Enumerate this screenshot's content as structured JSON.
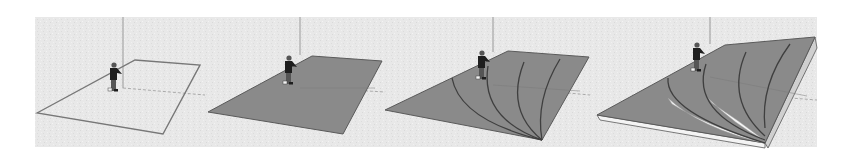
{
  "figure": {
    "description": "Four-step 3D modeling sequence of a sloped terrain surface with a human scale figure",
    "background": {
      "x": 35,
      "y": 17,
      "w": 782,
      "h": 130,
      "color": "#e9e9e9"
    },
    "colors": {
      "face": "#8a8a8a",
      "face_light": "#b9b9b9",
      "side": "#cfcfcf",
      "edge": "#5a5a5a",
      "outline": "#777777",
      "axis": "#9a9a9a",
      "highlight": "#f4f4f4",
      "figure_dark": "#1e1e1e",
      "figure_mid": "#555555"
    },
    "panels": [
      {
        "step": 1,
        "label": "Rectangle outline drawn on ground plane",
        "style": "outline",
        "quad": [
          [
            37,
            113
          ],
          [
            135,
            60
          ],
          [
            200,
            65
          ],
          [
            163,
            134
          ]
        ],
        "axis_x": 123,
        "axis_top": 17,
        "axis_bottom": 88,
        "ground_line": [
          [
            123,
            88
          ],
          [
            205,
            95
          ]
        ],
        "person": {
          "x": 113,
          "y": 62
        },
        "arcs": [],
        "ribbons": [],
        "thickness": null
      },
      {
        "step": 2,
        "label": "Rectangle face filled",
        "style": "filled",
        "quad": [
          [
            208,
            112
          ],
          [
            312,
            56
          ],
          [
            382,
            61
          ],
          [
            343,
            134
          ]
        ],
        "axis_x": 300,
        "axis_top": 17,
        "axis_bottom": 55,
        "ground_line": [
          [
            300,
            87
          ],
          [
            385,
            92
          ]
        ],
        "person": {
          "x": 288,
          "y": 55
        },
        "arcs": [],
        "ribbons": [],
        "thickness": null
      },
      {
        "step": 3,
        "label": "Curved contour arcs drawn on face",
        "style": "filled",
        "quad": [
          [
            385,
            110
          ],
          [
            508,
            51
          ],
          [
            589,
            57
          ],
          [
            542,
            140
          ]
        ],
        "axis_x": 493,
        "axis_top": 17,
        "axis_bottom": 52,
        "ground_line": [
          [
            493,
            86
          ],
          [
            590,
            95
          ]
        ],
        "person": {
          "x": 481,
          "y": 50
        },
        "arcs": [
          "M 452 78 Q 460 120 542 140",
          "M 488 66 Q 480 118 542 140",
          "M 524 62 Q 505 110 542 140",
          "M 560 59 Q 535 100 542 140"
        ],
        "ribbons": [],
        "thickness": null
      },
      {
        "step": 4,
        "label": "Contours pushed/pulled into stepped slope",
        "style": "extruded",
        "quad": [
          [
            597,
            115
          ],
          [
            725,
            45
          ],
          [
            815,
            37
          ],
          [
            765,
            143
          ]
        ],
        "axis_x": 710,
        "axis_top": 17,
        "axis_bottom": 44,
        "ground_line": [
          [
            710,
            92
          ],
          [
            817,
            100
          ]
        ],
        "person": {
          "x": 696,
          "y": 42
        },
        "arcs": [
          "M 668 78 Q 665 112 765 143",
          "M 706 64 Q 690 112 765 140",
          "M 746 52 Q 725 100 765 136",
          "M 790 44 Q 760 85 765 128"
        ],
        "ribbons": [
          "M 668 98 Q 700 128 764 143 Q 705 125 672 104 Z",
          "M 708 98 Q 735 125 764 140 Q 738 120 712 103 Z"
        ],
        "thickness": {
          "bottom_edge": [
            [
              597,
              115
            ],
            [
              600,
              120
            ],
            [
              765,
              148
            ],
            [
              765,
              143
            ]
          ],
          "side_face": [
            [
              815,
              37
            ],
            [
              817,
              48
            ],
            [
              768,
              148
            ],
            [
              765,
              143
            ]
          ]
        }
      }
    ]
  }
}
